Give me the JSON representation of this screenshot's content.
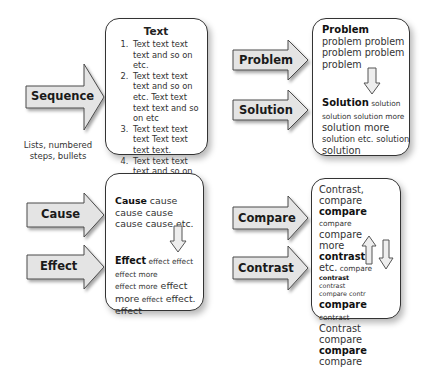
{
  "colors": {
    "arrow_fill": "#e4e4e4",
    "arrow_stroke": "#4a4a4a",
    "box_border": "#333333",
    "background": "#ffffff"
  },
  "panels": {
    "sequence": {
      "arrow_label": "Sequence",
      "caption_lines": [
        "Lists, numbered",
        "steps, bullets"
      ],
      "box_title": "Text",
      "items": [
        "Text text text text and so on etc.",
        "Text text text text and so on etc. Text text text text and so on etc",
        "Text text text text Text text text text.",
        "Text text text text and so on etc.",
        "Text text text text."
      ]
    },
    "problem_solution": {
      "arrow_labels": [
        "Problem",
        "Solution"
      ],
      "problem_heading": "Problem",
      "problem_text": "problem problem problem problem problem",
      "solution_heading": "Solution",
      "solution_parts": [
        " solution solution solution more",
        "solution more",
        "solution etc. solution",
        "solution"
      ]
    },
    "cause_effect": {
      "arrow_labels": [
        "Cause",
        "Effect"
      ],
      "cause_heading": "Cause",
      "cause_text": " cause cause cause cause cause etc.",
      "effect_heading": "Effect",
      "effect_parts": [
        " effect effect effect more",
        " effect more",
        " effect more effect effect.",
        "effect"
      ]
    },
    "compare_contrast": {
      "arrow_labels": [
        "Compare",
        "Contrast"
      ],
      "lines": [
        {
          "text": "Contrast, compare",
          "style": "l"
        },
        {
          "text": "compare",
          "style": "bold"
        },
        {
          "text": "compare",
          "style": "s",
          "rest": " compare"
        },
        {
          "text": "more",
          "style": "l"
        },
        {
          "text": "contrast",
          "style": "bold"
        },
        {
          "text": "etc.",
          "style": "l",
          "rest": " compare"
        },
        {
          "text": "contrast",
          "style": "xs-bold"
        },
        {
          "text": "contrast",
          "style": "xs"
        },
        {
          "text": "compare contr",
          "style": "xs"
        },
        {
          "text": "compare",
          "style": "bold",
          "rest": " contrast"
        },
        {
          "text": "Contrast compare",
          "style": "l"
        },
        {
          "text": "compare",
          "style": "bold",
          "rest": " compare"
        }
      ]
    }
  }
}
